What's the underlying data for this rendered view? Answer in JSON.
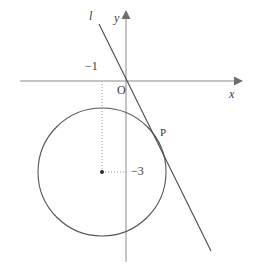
{
  "figure": {
    "type": "geometry-diagram",
    "background_color": "#ffffff",
    "stroke_color": "#555555",
    "axis_color": "#8a8a8a",
    "text_color": "#3a3a3a",
    "width": 253,
    "height": 272
  },
  "axes": {
    "x_label": "x",
    "y_label": "y",
    "origin_label": "O",
    "x_axis": {
      "x1": 20,
      "y1": 81,
      "x2": 238,
      "y2": 81
    },
    "y_axis": {
      "x1": 126,
      "y1": 15,
      "x2": 126,
      "y2": 262
    },
    "origin_px": {
      "x": 126,
      "y": 81
    }
  },
  "ticks": [
    {
      "label": "−1",
      "value": -1,
      "axis": "x",
      "px": {
        "x": 102,
        "y": 81
      },
      "label_px": {
        "x": 86,
        "y": 61
      }
    },
    {
      "label": "−3",
      "value": -3,
      "axis": "y",
      "px": {
        "x": 126,
        "y": 172
      },
      "label_px": {
        "x": 132,
        "y": 165
      }
    }
  ],
  "circle": {
    "name": "circle",
    "center_px": {
      "x": 102,
      "y": 172
    },
    "radius_px": 64,
    "center_coords": {
      "x": -1,
      "y": -3
    },
    "center_dot": true
  },
  "line": {
    "name": "line-l",
    "label": "l",
    "label_px": {
      "x": 89,
      "y": 10
    },
    "start_px": {
      "x": 99,
      "y": 24
    },
    "end_px": {
      "x": 211,
      "y": 251
    },
    "tangent": true
  },
  "points": [
    {
      "label": "P",
      "name": "point-p",
      "px": {
        "x": 155,
        "y": 127
      },
      "label_px": {
        "x": 160,
        "y": 128
      }
    }
  ],
  "guides": [
    {
      "name": "vertical-guide-x-minus-1",
      "style": "dotted",
      "x1": 102,
      "y1": 81,
      "x2": 102,
      "y2": 172
    },
    {
      "name": "horizontal-guide-y-minus-3",
      "style": "dotted",
      "x1": 102,
      "y1": 172,
      "x2": 126,
      "y2": 172
    }
  ]
}
